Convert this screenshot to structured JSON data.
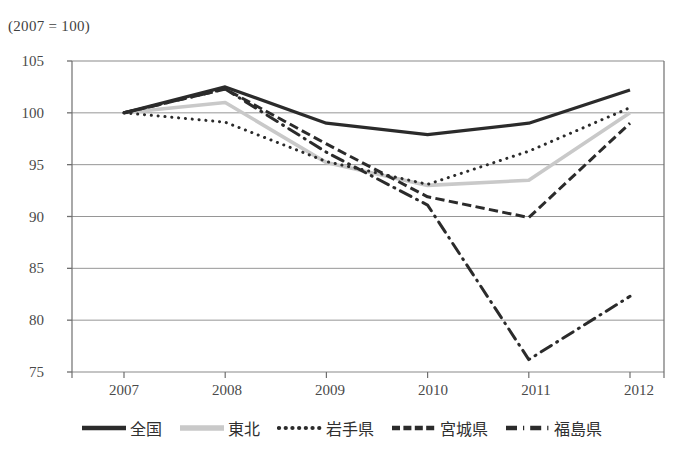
{
  "unit_note": "(2007 = 100)",
  "chart_data": {
    "type": "line",
    "title": "",
    "subtitle": "",
    "annotations": [
      "(2007 = 100)"
    ],
    "xlabel": "",
    "ylabel": "",
    "x": [
      "2007",
      "2008",
      "2009",
      "2010",
      "2011",
      "2012"
    ],
    "categories": [
      "2007",
      "2008",
      "2009",
      "2010",
      "2011",
      "2012"
    ],
    "xtick_labels": [
      "2007",
      "2008",
      "2009",
      "2010",
      "2011",
      "2012"
    ],
    "ytick_labels": [
      "75",
      "80",
      "85",
      "90",
      "95",
      "100",
      "105"
    ],
    "ylim": [
      75,
      105
    ],
    "ytick_step": 5,
    "grid": "horizontal",
    "legend_position": "bottom",
    "series": [
      {
        "name": "全国",
        "values": [
          100.0,
          102.5,
          99.0,
          97.9,
          99.0,
          102.2
        ],
        "style": "solid",
        "color": "#2b2b2b",
        "width": 3.2,
        "legend_icon": "solid-line"
      },
      {
        "name": "東北",
        "values": [
          100.0,
          101.0,
          95.2,
          93.0,
          93.5,
          100.0
        ],
        "style": "solid",
        "color": "#c9c9c9",
        "width": 3.6,
        "legend_icon": "solid-line-light"
      },
      {
        "name": "岩手県",
        "values": [
          100.0,
          99.1,
          95.3,
          93.1,
          96.3,
          100.5
        ],
        "style": "dotted",
        "color": "#2b2b2b",
        "width": 3.0,
        "legend_icon": "dotted-line"
      },
      {
        "name": "宮城県",
        "values": [
          100.0,
          102.3,
          97.0,
          91.9,
          89.9,
          99.0
        ],
        "style": "dashed",
        "color": "#2b2b2b",
        "width": 3.0,
        "legend_icon": "dashed-line"
      },
      {
        "name": "福島県",
        "values": [
          100.0,
          102.3,
          96.2,
          91.1,
          76.2,
          82.3
        ],
        "style": "dash-dot",
        "color": "#2b2b2b",
        "width": 3.0,
        "legend_icon": "dash-dot-line"
      }
    ]
  },
  "legend": {
    "items": [
      {
        "label": "全国"
      },
      {
        "label": "東北"
      },
      {
        "label": "岩手県"
      },
      {
        "label": "宮城県"
      },
      {
        "label": "福島県"
      }
    ]
  },
  "axes": {
    "y": {
      "labels": [
        "105",
        "100",
        "95",
        "90",
        "85",
        "80",
        "75"
      ]
    },
    "x": {
      "labels": [
        "2007",
        "2008",
        "2009",
        "2010",
        "2011",
        "2012"
      ]
    }
  },
  "colors": {
    "axis": "#6f6f6f",
    "grid": "#8a8a8a",
    "dark_series": "#2b2b2b",
    "light_series": "#c9c9c9",
    "text": "#3f3f3f"
  }
}
